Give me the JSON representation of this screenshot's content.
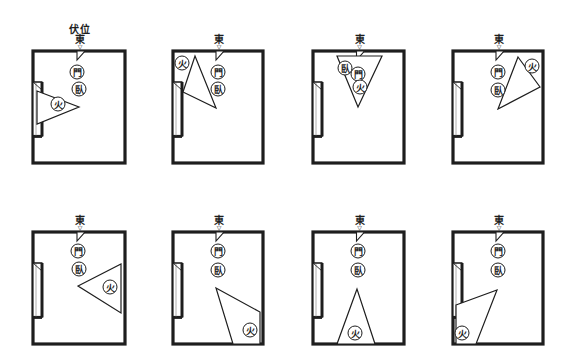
{
  "figure": {
    "title_label": "伏位",
    "direction_label": "東",
    "arrow_glyph": "▽",
    "door_glyph": "門",
    "bed_glyph": "臥",
    "stove_glyph": "火",
    "colors": {
      "line": "#1e1e1e",
      "background": "#ffffff"
    }
  },
  "diagrams": [
    {
      "id": 1,
      "room": {
        "x": 33,
        "y": 51,
        "w": 92,
        "h": 112
      },
      "door": [
        77,
        72
      ],
      "bed": [
        79,
        89
      ],
      "triangle": [
        [
          37,
          91
        ],
        [
          79,
          107
        ],
        [
          37,
          124
        ]
      ],
      "stove": [
        58,
        104
      ],
      "show_title": true
    },
    {
      "id": 2,
      "room": {
        "x": 173,
        "y": 51,
        "w": 90,
        "h": 112
      },
      "door": [
        218,
        72
      ],
      "bed": [
        218,
        89
      ],
      "triangle": [
        [
          195,
          56
        ],
        [
          216,
          108
        ],
        [
          183,
          92
        ]
      ],
      "stove": [
        182,
        63
      ],
      "show_title": false
    },
    {
      "id": 3,
      "room": {
        "x": 313,
        "y": 51,
        "w": 91,
        "h": 112
      },
      "door": [
        358,
        74
      ],
      "bed": [
        345,
        68
      ],
      "triangle": [
        [
          337,
          56
        ],
        [
          382,
          56
        ],
        [
          358,
          107
        ]
      ],
      "stove": [
        360,
        87
      ],
      "show_title": false
    },
    {
      "id": 4,
      "room": {
        "x": 453,
        "y": 51,
        "w": 90,
        "h": 112
      },
      "door": [
        498,
        72
      ],
      "bed": [
        498,
        90
      ],
      "triangle": [
        [
          518,
          57
        ],
        [
          540,
          87
        ],
        [
          498,
          109
        ]
      ],
      "stove": [
        532,
        66
      ],
      "show_title": false
    },
    {
      "id": 5,
      "room": {
        "x": 33,
        "y": 232,
        "w": 92,
        "h": 112
      },
      "door": [
        78,
        251
      ],
      "bed": [
        79,
        269
      ],
      "triangle": [
        [
          121,
          264
        ],
        [
          121,
          313
        ],
        [
          78,
          286
        ]
      ],
      "stove": [
        110,
        287
      ],
      "show_title": false
    },
    {
      "id": 6,
      "room": {
        "x": 173,
        "y": 232,
        "w": 90,
        "h": 112
      },
      "door": [
        218,
        251
      ],
      "bed": [
        218,
        270
      ],
      "triangle": [
        [
          216,
          288
        ],
        [
          260,
          312
        ],
        [
          260,
          344
        ],
        [
          233,
          344
        ]
      ],
      "stove": [
        250,
        330
      ],
      "show_title": false
    },
    {
      "id": 7,
      "room": {
        "x": 313,
        "y": 232,
        "w": 91,
        "h": 112
      },
      "door": [
        358,
        251
      ],
      "bed": [
        358,
        270
      ],
      "triangle": [
        [
          357,
          289
        ],
        [
          337,
          344
        ],
        [
          375,
          344
        ]
      ],
      "stove": [
        355,
        333
      ],
      "show_title": false
    },
    {
      "id": 8,
      "room": {
        "x": 453,
        "y": 232,
        "w": 90,
        "h": 112
      },
      "door": [
        498,
        251
      ],
      "bed": [
        498,
        270
      ],
      "triangle": [
        [
          456,
          305
        ],
        [
          497,
          290
        ],
        [
          476,
          344
        ],
        [
          456,
          344
        ]
      ],
      "stove": [
        462,
        333
      ],
      "show_title": false
    }
  ]
}
